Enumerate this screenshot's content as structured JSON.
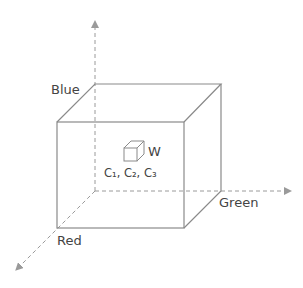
{
  "diagram": {
    "type": "rgb-color-cube",
    "axes": {
      "blue": {
        "label": "Blue"
      },
      "green": {
        "label": "Green"
      },
      "red": {
        "label": "Red"
      }
    },
    "inner_cube": {
      "label": "W",
      "caption": "C₁, C₂, C₃"
    },
    "colors": {
      "stroke": "#8a8a8a",
      "dash": "#9a9a9a",
      "text": "#444444",
      "background": "#ffffff"
    }
  }
}
